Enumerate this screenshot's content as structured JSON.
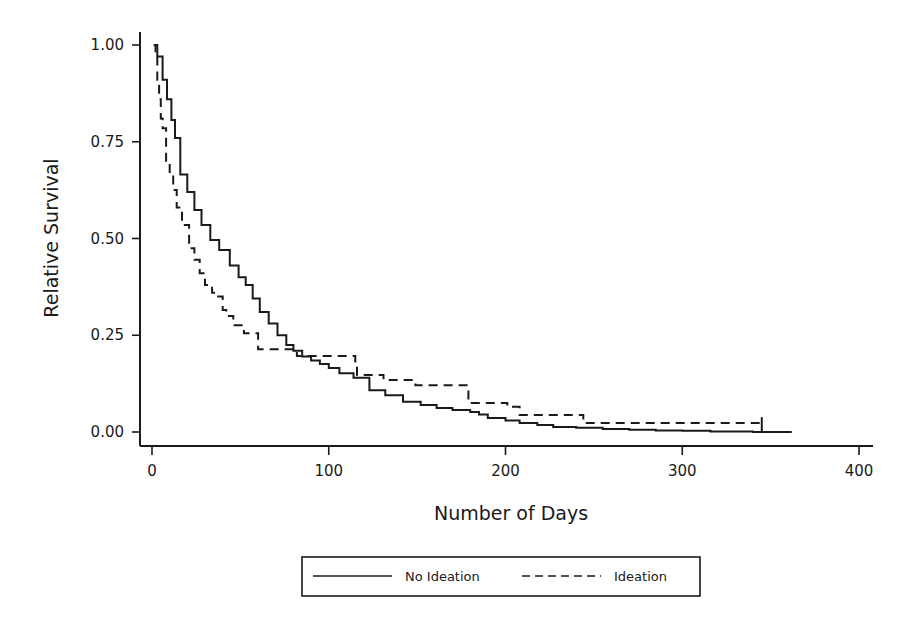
{
  "chart_data": {
    "type": "line",
    "subtype": "kaplan-meier-step",
    "title": "",
    "xlabel": "Number of Days",
    "ylabel": "Relative Survival",
    "xlim": [
      -5,
      410
    ],
    "ylim": [
      0,
      1
    ],
    "x_ticks": [
      0,
      100,
      200,
      300,
      400
    ],
    "x_tick_labels": [
      "0",
      "100",
      "200",
      "300",
      "400"
    ],
    "y_ticks": [
      0,
      0.25,
      0.5,
      0.75,
      1.0
    ],
    "y_tick_labels": [
      "0.00",
      "0.25",
      "0.50",
      "0.75",
      "1.00"
    ],
    "grid": false,
    "legend_position": "bottom-center, boxed",
    "series": [
      {
        "name": "No Ideation",
        "style": "solid",
        "color": "#1a1a1a",
        "x": [
          1,
          3,
          6,
          8.5,
          11,
          13,
          16,
          20,
          24,
          28,
          33,
          38,
          44,
          49,
          53,
          57,
          61,
          66,
          71,
          76,
          80,
          85,
          90,
          95,
          100,
          106,
          114,
          123,
          132,
          142,
          152,
          161,
          170,
          180,
          185,
          190,
          200,
          208,
          218,
          227,
          240,
          255,
          270,
          285,
          300,
          316,
          340,
          362
        ],
        "y": [
          1.0,
          0.97,
          0.91,
          0.86,
          0.806,
          0.76,
          0.665,
          0.62,
          0.574,
          0.535,
          0.496,
          0.47,
          0.43,
          0.4,
          0.38,
          0.345,
          0.31,
          0.28,
          0.25,
          0.225,
          0.21,
          0.195,
          0.185,
          0.176,
          0.165,
          0.152,
          0.14,
          0.108,
          0.095,
          0.078,
          0.07,
          0.062,
          0.057,
          0.052,
          0.045,
          0.036,
          0.03,
          0.023,
          0.018,
          0.013,
          0.011,
          0.008,
          0.006,
          0.004,
          0.003,
          0.001,
          0.0,
          0.0
        ]
      },
      {
        "name": "Ideation",
        "style": "dashed",
        "color": "#1a1a1a",
        "x": [
          1,
          2,
          3,
          4,
          5,
          6,
          8,
          10,
          12,
          14,
          17,
          21,
          24,
          27,
          30,
          34,
          36,
          40,
          42,
          46,
          52,
          60,
          82,
          115,
          116,
          131,
          149,
          179,
          184,
          201,
          208,
          244,
          345
        ],
        "y": [
          1.0,
          0.974,
          0.91,
          0.86,
          0.81,
          0.785,
          0.7,
          0.665,
          0.625,
          0.58,
          0.535,
          0.475,
          0.445,
          0.41,
          0.38,
          0.36,
          0.35,
          0.315,
          0.3,
          0.276,
          0.255,
          0.214,
          0.196,
          0.176,
          0.147,
          0.134,
          0.121,
          0.075,
          0.075,
          0.065,
          0.044,
          0.023,
          0.023
        ],
        "censor_marks": [
          {
            "x": 345,
            "y": 0.023
          }
        ]
      }
    ],
    "annotations": []
  },
  "legend": {
    "items": [
      {
        "label": "No Ideation",
        "style": "solid"
      },
      {
        "label": "Ideation",
        "style": "dashed"
      }
    ]
  }
}
